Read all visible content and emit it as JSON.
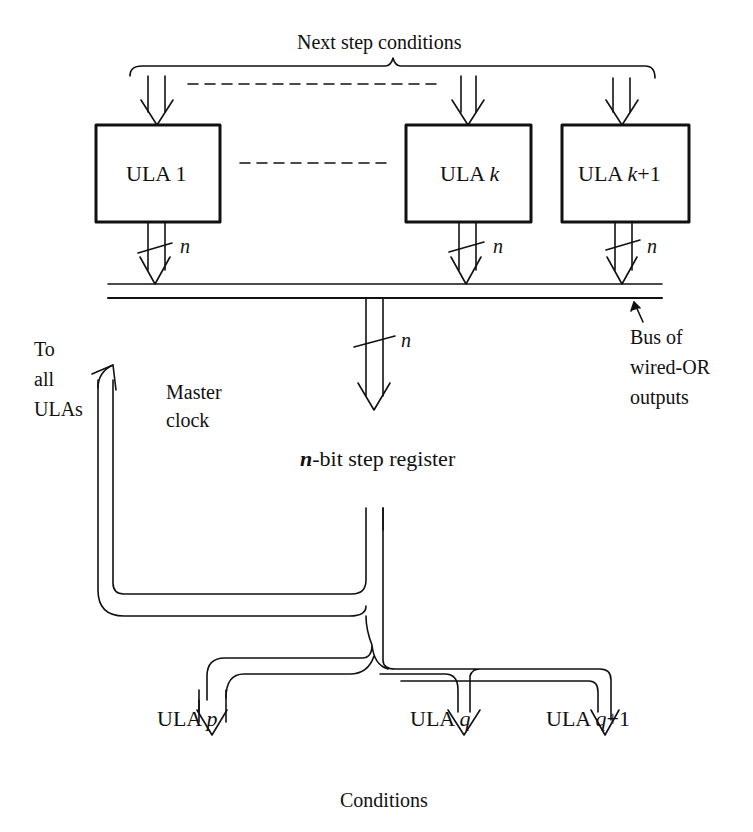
{
  "diagram": {
    "top_label": "Next step conditions",
    "bottom_label": "Conditions",
    "top_ulas": [
      {
        "prefix": "ULA ",
        "suffix": "1",
        "suffix_italic": false,
        "extra": ""
      },
      {
        "prefix": "ULA ",
        "suffix": "k",
        "suffix_italic": true,
        "extra": ""
      },
      {
        "prefix": "ULA ",
        "suffix": "k",
        "suffix_italic": true,
        "extra": "+1"
      }
    ],
    "bottom_ulas": [
      {
        "prefix": "ULA ",
        "suffix": "p",
        "suffix_italic": true,
        "extra": ""
      },
      {
        "prefix": "ULA ",
        "suffix": "q",
        "suffix_italic": true,
        "extra": ""
      },
      {
        "prefix": "ULA ",
        "suffix": "q",
        "suffix_italic": true,
        "extra": "+1"
      }
    ],
    "bus_width_label": "n",
    "bus_annotation": "Bus of\nwired-OR\noutputs",
    "feedback_annotation": "To\nall\nULAs",
    "clock_label": "Master\nclock",
    "register": {
      "prefix": "n",
      "suffix": "-bit step register"
    },
    "colors": {
      "ink": "#111111",
      "background": "#ffffff"
    }
  }
}
